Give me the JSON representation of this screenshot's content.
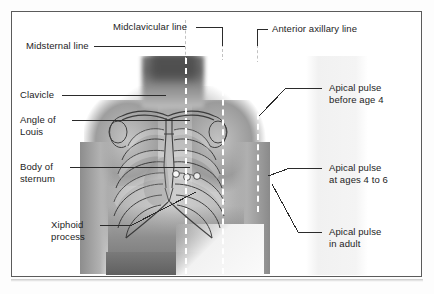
{
  "figure": {
    "kind": "anatomical-diagram"
  },
  "labels": {
    "midclavicular_line": "Midclavicular line",
    "midsternal_line": "Midsternal line",
    "anterior_axillary_line": "Anterior axillary line",
    "clavicle": "Clavicle",
    "angle_of_louis_1": "Angle of",
    "angle_of_louis_2": "Louis",
    "body_of_sternum_1": "Body of",
    "body_of_sternum_2": "sternum",
    "xiphoid_process_1": "Xiphoid",
    "xiphoid_process_2": "process",
    "apical_before_age4_1": "Apical pulse",
    "apical_before_age4_2": "before age 4",
    "apical_ages4to6_1": "Apical pulse",
    "apical_ages4to6_2": "at ages 4 to 6",
    "apical_adult_1": "Apical pulse",
    "apical_adult_2": "in adult"
  },
  "landmark_lines": [
    {
      "name": "midsternal-line",
      "style": "white-dashed",
      "x": 185
    },
    {
      "name": "midclavicular-line",
      "style": "white-dashed",
      "x": 222
    },
    {
      "name": "anterior-axillary-line",
      "style": "white-dashed",
      "x": 257
    }
  ],
  "apical_pulse_markers": [
    {
      "name": "apical-pulse-before-age-4",
      "x": 218,
      "y": 174
    },
    {
      "name": "apical-pulse-ages-4-to-6",
      "x": 228,
      "y": 177
    },
    {
      "name": "apical-pulse-adult",
      "x": 238,
      "y": 176
    }
  ],
  "colors": {
    "frame": "#5b5b5b",
    "text": "#1d1d1d",
    "leader": "#2b2b2b",
    "dashed_line": "#ffffff",
    "background": "#ffffff"
  }
}
